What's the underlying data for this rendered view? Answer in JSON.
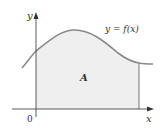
{
  "figure": {
    "curve_label": "y = f(x)",
    "region_label": "A",
    "x_axis_label": "x",
    "y_axis_label": "y",
    "origin_label": "0"
  },
  "colors": {
    "fill": "#efefef",
    "curve": "#8a8a8a",
    "axes": "#333333",
    "text": "#333333"
  }
}
